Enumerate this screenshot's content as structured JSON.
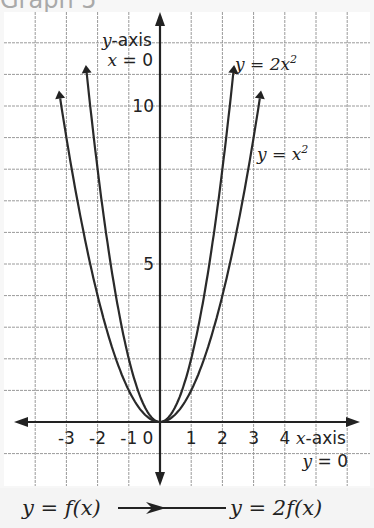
{
  "title": "Graph 5",
  "chart_data": {
    "type": "line",
    "title": "Graph 5",
    "xlabel": "x-axis",
    "xlabel_eq": "y = 0",
    "ylabel": "y-axis",
    "ylabel_eq": "x = 0",
    "xlim": [
      -5,
      6
    ],
    "ylim": [
      -1,
      12
    ],
    "x_ticks": [
      -3,
      -2,
      -1,
      0,
      1,
      2,
      3,
      4
    ],
    "x_tick_labels": [
      "-3",
      "-2",
      "-1",
      "0",
      "1",
      "2",
      "3",
      "4"
    ],
    "y_ticks": [
      5,
      10
    ],
    "y_tick_labels": [
      "5",
      "10"
    ],
    "grid": true,
    "series": [
      {
        "name": "y = x²",
        "label_prefix": "y = x",
        "exp": "2",
        "coef": 1,
        "x_range": [
          -3.2,
          3.2
        ]
      },
      {
        "name": "y = 2x²",
        "label_prefix": "y = 2x",
        "exp": "2",
        "coef": 2,
        "x_range": [
          -2.35,
          2.35
        ]
      }
    ]
  },
  "transformation": {
    "from": "y = f(x)",
    "to": "y =  2f(x)"
  }
}
